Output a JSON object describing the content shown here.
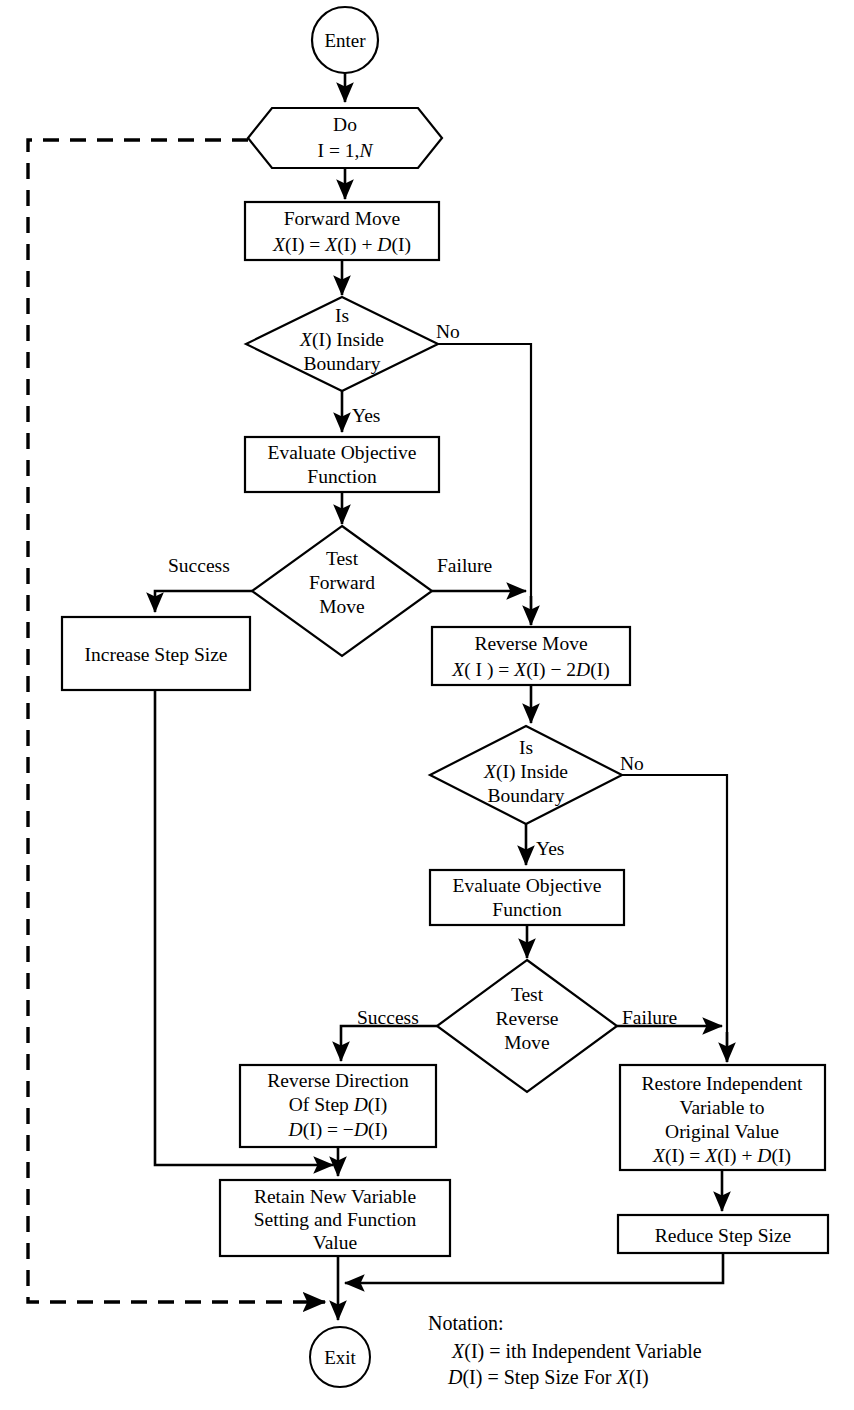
{
  "diagram": {
    "terminators": {
      "enter": "Enter",
      "exit": "Exit"
    },
    "loop_node": {
      "line1": "Do",
      "line2_prefix": "I = 1,",
      "line2_var": "N"
    },
    "nodes": {
      "forward_move": {
        "line1": "Forward Move",
        "line2_a": "X",
        "line2_b": "(I) = ",
        "line2_c": "X",
        "line2_d": "(I) + ",
        "line2_e": "D",
        "line2_f": "(I)",
        "text": "Forward Move / X(I) = X(I) + D(I)"
      },
      "boundary_test_1": {
        "line1": "Is",
        "line2_a": "X",
        "line2_b": "(I) Inside",
        "line3": "Boundary",
        "text": "Is X(I) Inside Boundary"
      },
      "evaluate_1": {
        "line1": "Evaluate Objective",
        "line2": "Function"
      },
      "test_forward": {
        "line1": "Test",
        "line2": "Forward",
        "line3": "Move"
      },
      "increase_step": {
        "line1": "Increase Step Size"
      },
      "reverse_move": {
        "line1": "Reverse Move",
        "line2_a": "X",
        "line2_b": "( I ) = ",
        "line2_c": "X",
        "line2_d": "(I) − 2",
        "line2_e": "D",
        "line2_f": "(I)",
        "text": "Reverse Move / X( I ) = X(I) − 2D(I)"
      },
      "boundary_test_2": {
        "line1": "Is",
        "line2_a": "X",
        "line2_b": "(I) Inside",
        "line3": "Boundary",
        "text": "Is X(I) Inside Boundary"
      },
      "evaluate_2": {
        "line1": "Evaluate Objective",
        "line2": "Function"
      },
      "test_reverse": {
        "line1": "Test",
        "line2": "Reverse",
        "line3": "Move"
      },
      "reverse_direction": {
        "line1": "Reverse Direction",
        "line2_a": "Of Step ",
        "line2_b": "D",
        "line2_c": "(I)",
        "line3_a": "D",
        "line3_b": "(I) = −",
        "line3_c": "D",
        "line3_d": "(I)",
        "text": "Reverse Direction Of Step D(I) / D(I) = −D(I)"
      },
      "restore_variable": {
        "line1": "Restore Independent",
        "line2": "Variable to",
        "line3": "Original Value",
        "line4_a": "X",
        "line4_b": "(I) = ",
        "line4_c": "X",
        "line4_d": "(I) + ",
        "line4_e": "D",
        "line4_f": "(I)",
        "text": "Restore Independent Variable to Original Value / X(I) = X(I) + D(I)"
      },
      "retain_setting": {
        "line1": "Retain New Variable",
        "line2": "Setting and Function",
        "line3": "Value"
      },
      "reduce_step": {
        "line1": "Reduce Step Size"
      }
    },
    "edge_labels": {
      "no_1": "No",
      "yes_1": "Yes",
      "success_1": "Success",
      "failure_1": "Failure",
      "no_2": "No",
      "yes_2": "Yes",
      "success_2": "Success",
      "failure_2": "Failure"
    },
    "notation": {
      "heading": "Notation:",
      "line1_a": "X",
      "line1_b": "(I) = ith Independent Variable",
      "line2_a": "D",
      "line2_b": "(I)  = Step Size For ",
      "line2_c": "X",
      "line2_d": "(I)",
      "text1": "X(I) = ith Independent Variable",
      "text2": "D(I)  = Step Size For X(I)"
    },
    "colors": {
      "stroke": "#000000",
      "fill": "#ffffff",
      "background": "#ffffff"
    }
  }
}
